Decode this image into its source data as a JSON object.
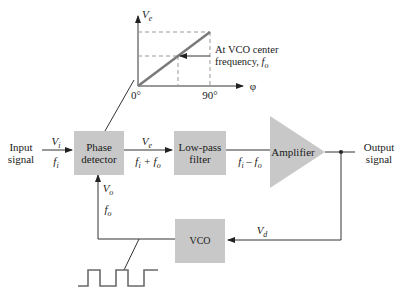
{
  "graph": {
    "y_axis_label": "V",
    "y_axis_sub": "e",
    "x_axis_label": "φ",
    "x_tick_0": "0°",
    "x_tick_90": "90°",
    "annotation_line1": "At VCO center",
    "annotation_line2": "frequency, ",
    "annotation_f": "f",
    "annotation_sub": "o"
  },
  "blocks": {
    "phase_detector_line1": "Phase",
    "phase_detector_line2": "detector",
    "low_pass_line1": "Low-pass",
    "low_pass_line2": "filter",
    "amplifier": "Amplifier",
    "vco": "VCO"
  },
  "labels": {
    "input_line1": "Input",
    "input_line2": "signal",
    "output_line1": "Output",
    "output_line2": "signal",
    "vi": "V",
    "vi_sub": "i",
    "fi": "f",
    "fi_sub": "i",
    "ve": "V",
    "ve_sub": "e",
    "fi_plus_fo": "f",
    "sum_sub_i": "i",
    "sum_op": " + f",
    "sum_sub_o": "o",
    "diff_f": "f",
    "diff_sub_i": "i",
    "diff_op": " – f",
    "diff_sub_o": "o",
    "vo": "V",
    "vo_sub": "o",
    "fo": "f",
    "fo_sub": "o",
    "vd": "V",
    "vd_sub": "d"
  },
  "colors": {
    "block_fill": "#c8c8c8",
    "line": "#333333",
    "graph_line": "#7a7a7a",
    "dashed": "#999999"
  }
}
